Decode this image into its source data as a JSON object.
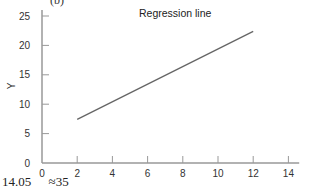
{
  "chart_data": {
    "type": "line",
    "panel_label": "(b)",
    "title": "Regression line",
    "xlabel": "",
    "ylabel": "Y",
    "xlim": [
      0,
      14.5
    ],
    "ylim": [
      0,
      26
    ],
    "x_ticks": [
      0,
      2,
      4,
      6,
      8,
      10,
      12,
      14
    ],
    "y_ticks": [
      0,
      5,
      10,
      15,
      20,
      25
    ],
    "grid": false,
    "series": [
      {
        "name": "Regression line",
        "x": [
          2,
          12
        ],
        "y": [
          7.4,
          22.4
        ],
        "color": "#666666"
      }
    ]
  },
  "footer": {
    "values": [
      "14.05",
      "≈35"
    ]
  }
}
